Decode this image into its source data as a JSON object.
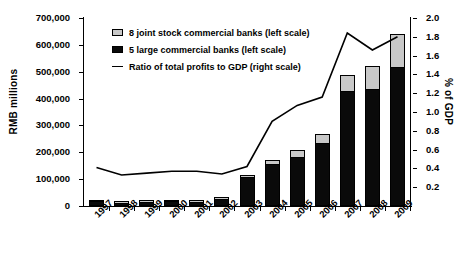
{
  "chart_data": {
    "type": "bar",
    "title": "",
    "subtitle": "",
    "categories": [
      "1997",
      "1998",
      "1999",
      "2000",
      "2001",
      "2002",
      "2003",
      "2004",
      "2005",
      "2006",
      "2007",
      "2008",
      "2009"
    ],
    "xlabel": "",
    "ylabel": "RMB millions",
    "y2label": "% of GDP",
    "ylim": [
      0,
      700000
    ],
    "y2lim": [
      0,
      2.0
    ],
    "ytick_labels": [
      "0",
      "100,000",
      "200,000",
      "300,000",
      "400,000",
      "500,000",
      "600,000",
      "700,000"
    ],
    "ytick_values": [
      0,
      100000,
      200000,
      300000,
      400000,
      500000,
      600000,
      700000
    ],
    "y2tick_labels": [
      "0.0",
      "0.2",
      "0.4",
      "0.6",
      "0.8",
      "1.0",
      "1.2",
      "1.4",
      "1.6",
      "1.8",
      "2.0"
    ],
    "y2tick_values": [
      0,
      0.2,
      0.4,
      0.6,
      0.8,
      1.0,
      1.2,
      1.4,
      1.6,
      1.8,
      2.0
    ],
    "grid": false,
    "legend_position": "upper-left",
    "stacked": true,
    "series": [
      {
        "name": "5 large commercial banks (left scale)",
        "type": "bar",
        "axis": "left",
        "color": "#0a0a0a",
        "values": [
          14000,
          9000,
          12000,
          14000,
          12000,
          22000,
          103000,
          153000,
          180000,
          230000,
          425000,
          432000,
          515000
        ]
      },
      {
        "name": "8 joint stock commercial banks (left scale)",
        "type": "bar",
        "axis": "left",
        "color": "#c8c8c8",
        "values": [
          5000,
          4000,
          4000,
          5000,
          5000,
          10000,
          14000,
          20000,
          30000,
          40000,
          62000,
          88000,
          125000
        ]
      },
      {
        "name": "Ratio of total profits to GDP (right scale)",
        "type": "line",
        "axis": "right",
        "color": "#000000",
        "values": [
          0.41,
          0.33,
          0.35,
          0.37,
          0.37,
          0.34,
          0.42,
          0.9,
          1.07,
          1.16,
          1.84,
          1.66,
          1.8
        ]
      }
    ]
  },
  "legend": {
    "items": [
      {
        "label": "8 joint stock commercial banks (left scale)",
        "marker": "gray-square"
      },
      {
        "label": "5 large commercial banks (left scale)",
        "marker": "black-square"
      },
      {
        "label": "Ratio of total profits to GDP (right scale)",
        "marker": "line"
      }
    ]
  }
}
